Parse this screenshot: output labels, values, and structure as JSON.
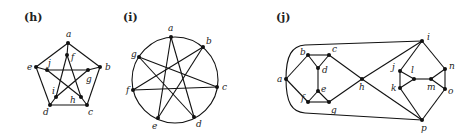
{
  "graphs": [
    {
      "id": "h",
      "label": "(h)",
      "label_pos": [
        24,
        21
      ],
      "vertices": {
        "a": [
          68,
          43
        ],
        "b": [
          100,
          67
        ],
        "c": [
          87,
          105
        ],
        "d": [
          50,
          105
        ],
        "e": [
          36,
          67
        ],
        "f": [
          67,
          55
        ],
        "g": [
          88,
          70
        ],
        "h": [
          81,
          97
        ],
        "i": [
          56,
          97
        ],
        "j": [
          47,
          70
        ]
      },
      "vertex_labels": {
        "a": [
          66,
          37
        ],
        "b": [
          105,
          70
        ],
        "c": [
          88,
          115
        ],
        "d": [
          43,
          115
        ],
        "e": [
          27,
          70
        ],
        "f": [
          71,
          60
        ],
        "g": [
          86,
          82
        ],
        "h": [
          70,
          103
        ],
        "i": [
          52,
          94
        ],
        "j": [
          48,
          66
        ]
      },
      "edges": [
        [
          "a",
          "b"
        ],
        [
          "b",
          "c"
        ],
        [
          "c",
          "d"
        ],
        [
          "d",
          "e"
        ],
        [
          "e",
          "a"
        ],
        [
          "a",
          "f"
        ],
        [
          "b",
          "g"
        ],
        [
          "c",
          "h"
        ],
        [
          "d",
          "i"
        ],
        [
          "e",
          "j"
        ],
        [
          "f",
          "h"
        ],
        [
          "f",
          "i"
        ],
        [
          "g",
          "i"
        ],
        [
          "g",
          "j"
        ],
        [
          "h",
          "j"
        ]
      ]
    },
    {
      "id": "i",
      "label": "(i)",
      "label_pos": [
        123,
        21
      ],
      "circle": {
        "cx": 175,
        "cy": 80,
        "r": 43
      },
      "vertices": {
        "a": [
          171,
          37
        ],
        "b": [
          203,
          47
        ],
        "c": [
          217,
          87
        ],
        "d": [
          194,
          117
        ],
        "e": [
          158,
          118
        ],
        "f": [
          133,
          90
        ],
        "g": [
          139,
          57
        ]
      },
      "vertex_labels": {
        "a": [
          168,
          31
        ],
        "b": [
          206,
          44
        ],
        "c": [
          222,
          90
        ],
        "d": [
          196,
          127
        ],
        "e": [
          152,
          129
        ],
        "f": [
          126,
          93
        ],
        "g": [
          131,
          57
        ]
      },
      "edges": [
        [
          "a",
          "d"
        ],
        [
          "d",
          "g"
        ],
        [
          "g",
          "c"
        ],
        [
          "c",
          "f"
        ],
        [
          "f",
          "b"
        ],
        [
          "b",
          "e"
        ],
        [
          "e",
          "a"
        ]
      ]
    },
    {
      "id": "j",
      "label": "(j)",
      "label_pos": [
        276,
        21
      ],
      "vertices": {
        "a": [
          286,
          79
        ],
        "b": [
          308,
          55
        ],
        "c": [
          329,
          55
        ],
        "d": [
          318,
          68
        ],
        "e": [
          318,
          91
        ],
        "f": [
          308,
          102
        ],
        "g": [
          329,
          102
        ],
        "h": [
          362,
          79
        ],
        "i": [
          422,
          41
        ],
        "j": [
          400,
          71
        ],
        "k": [
          400,
          88
        ],
        "l": [
          414,
          79
        ],
        "m": [
          431,
          79
        ],
        "n": [
          445,
          69
        ],
        "o": [
          445,
          89
        ],
        "p": [
          422,
          120
        ]
      },
      "vertex_labels": {
        "a": [
          277,
          82
        ],
        "b": [
          300,
          55
        ],
        "c": [
          332,
          52
        ],
        "d": [
          322,
          73
        ],
        "e": [
          321,
          92
        ],
        "f": [
          301,
          101
        ],
        "g": [
          331,
          113
        ],
        "h": [
          359,
          90
        ],
        "i": [
          427,
          40
        ],
        "j": [
          392,
          70
        ],
        "k": [
          391,
          91
        ],
        "l": [
          411,
          73
        ],
        "m": [
          427,
          90
        ],
        "n": [
          449,
          69
        ],
        "o": [
          448,
          94
        ],
        "p": [
          421,
          131
        ]
      },
      "edges": [
        [
          "a",
          "b"
        ],
        [
          "a",
          "f"
        ],
        [
          "b",
          "c"
        ],
        [
          "b",
          "d"
        ],
        [
          "c",
          "d"
        ],
        [
          "c",
          "h"
        ],
        [
          "d",
          "e"
        ],
        [
          "e",
          "f"
        ],
        [
          "e",
          "g"
        ],
        [
          "f",
          "g"
        ],
        [
          "g",
          "h"
        ],
        [
          "h",
          "i"
        ],
        [
          "h",
          "p"
        ],
        [
          "i",
          "j"
        ],
        [
          "i",
          "n"
        ],
        [
          "p",
          "k"
        ],
        [
          "p",
          "o"
        ],
        [
          "j",
          "k"
        ],
        [
          "j",
          "l"
        ],
        [
          "k",
          "l"
        ],
        [
          "l",
          "m"
        ],
        [
          "m",
          "n"
        ],
        [
          "m",
          "o"
        ],
        [
          "n",
          "o"
        ]
      ],
      "curved_edges": [
        {
          "from": "a",
          "to": "i",
          "path": "M286,79 C286,55 292,46 305,45 L422,41"
        },
        {
          "from": "a",
          "to": "p",
          "path": "M286,79 C286,103 292,112 305,113 L422,120"
        }
      ]
    }
  ]
}
